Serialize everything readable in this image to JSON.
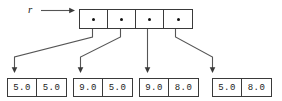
{
  "diagram": {
    "root_variable": {
      "label": "r",
      "arrow": "right-arrow"
    },
    "pointer_array": {
      "name": "pointer-array",
      "cell_count": 4,
      "cells": [
        {
          "index": 0,
          "content": "pointer-dot"
        },
        {
          "index": 1,
          "content": "pointer-dot"
        },
        {
          "index": 2,
          "content": "pointer-dot"
        },
        {
          "index": 3,
          "content": "pointer-dot"
        }
      ]
    },
    "value_arrays": [
      {
        "index": 0,
        "values": [
          "5.0",
          "5.0"
        ]
      },
      {
        "index": 1,
        "values": [
          "9.0",
          "5.0"
        ]
      },
      {
        "index": 2,
        "values": [
          "9.0",
          "8.0"
        ]
      },
      {
        "index": 3,
        "values": [
          "5.0",
          "8.0"
        ]
      }
    ],
    "colors": {
      "stroke": "#3a3a3a",
      "line": "#555555",
      "text": "#1a1a1a",
      "background": "#ffffff"
    }
  }
}
